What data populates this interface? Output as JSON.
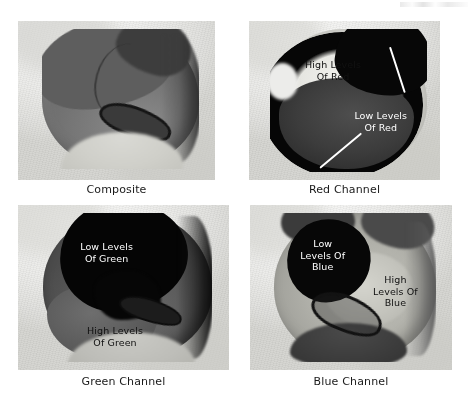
{
  "figure": {
    "panels": [
      {
        "id": "composite",
        "caption": "Composite",
        "annotations": []
      },
      {
        "id": "red-channel",
        "caption": "Red Channel",
        "annotations": [
          {
            "id": "high-levels-of-red",
            "text": "High Levels\nOf Red",
            "style": "dark"
          },
          {
            "id": "low-levels-of-red",
            "text": "Low Levels\nOf Red",
            "style": "light"
          }
        ]
      },
      {
        "id": "green-channel",
        "caption": "Green Channel",
        "annotations": [
          {
            "id": "low-levels-of-green",
            "text": "Low Levels\nOf Green",
            "style": "light"
          },
          {
            "id": "high-levels-of-green",
            "text": "High Levels\nOf Green",
            "style": "dark"
          }
        ]
      },
      {
        "id": "blue-channel",
        "caption": "Blue Channel",
        "annotations": [
          {
            "id": "low-levels-of-blue",
            "text": "Low\nLevels Of\nBlue",
            "style": "light"
          },
          {
            "id": "high-levels-of-blue",
            "text": "High\nLevels Of\nBlue",
            "style": "dark"
          }
        ]
      }
    ],
    "colors": {
      "background": "#ffffff",
      "caption_text": "#1a1a1a",
      "annotation_light": "#ffffff",
      "annotation_dark": "#111111",
      "leader_line": "#ffffff"
    }
  }
}
